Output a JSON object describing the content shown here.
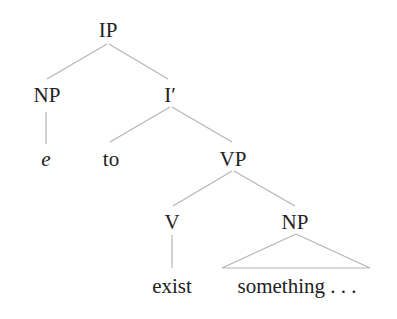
{
  "tree": {
    "ip": "IP",
    "np_subject": "NP",
    "i_bar": "I′",
    "empty": "e",
    "to": "to",
    "vp": "VP",
    "v": "V",
    "np_object": "NP",
    "exist": "exist",
    "something": "something . . ."
  },
  "colors": {
    "line": "#b8b8b8",
    "text": "#222222"
  }
}
